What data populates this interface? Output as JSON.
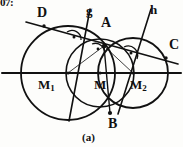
{
  "figure": {
    "caption": "(a)",
    "cropped_header_text": "07:",
    "ink_color": "#111111",
    "background_color": "#fdfdfb",
    "stroke_width": 1.6
  },
  "points": [
    {
      "id": "D",
      "label": "D",
      "x": 44,
      "y": 26,
      "label_x": 38,
      "label_y": 8
    },
    {
      "id": "A",
      "label": "A",
      "x": 104,
      "y": 46,
      "label_x": 103,
      "label_y": 20
    },
    {
      "id": "B",
      "label": "B",
      "x": 110,
      "y": 113,
      "label_x": 110,
      "label_y": 119
    },
    {
      "id": "C",
      "label": "C",
      "x": 166,
      "y": 58,
      "label_x": 170,
      "label_y": 40
    },
    {
      "id": "M",
      "label": "M",
      "x": 100,
      "y": 73,
      "label_x": 96,
      "label_y": 78
    },
    {
      "id": "M1",
      "label": "M",
      "sub": "1",
      "x": 68,
      "y": 73,
      "label_x": 40,
      "label_y": 79
    },
    {
      "id": "M2",
      "label": "M",
      "sub": "2",
      "x": 133,
      "y": 73,
      "label_x": 133,
      "label_y": 79
    }
  ],
  "lines": [
    {
      "id": "g",
      "label": "g",
      "label_x": 88,
      "label_y": 8,
      "x1": 89,
      "y1": 10,
      "x2": 70,
      "y2": 120
    },
    {
      "id": "h",
      "label": "h",
      "label_x": 152,
      "label_y": 7,
      "x1": 150,
      "y1": 10,
      "x2": 119,
      "y2": 113
    },
    {
      "id": "secant-DAC",
      "label": "",
      "x1": 26,
      "y1": 22,
      "x2": 178,
      "y2": 64
    },
    {
      "id": "center-line",
      "label": "",
      "x1": 2,
      "y1": 73,
      "x2": 181,
      "y2": 73
    }
  ],
  "circles": [
    {
      "id": "circle-M1",
      "center_x": 68,
      "center_y": 73,
      "radius": 47
    },
    {
      "id": "circle-M2",
      "center_x": 133,
      "center_y": 73,
      "radius": 35
    },
    {
      "id": "circle-M",
      "center_x": 100,
      "center_y": 73,
      "radius": 34
    }
  ],
  "angle_marks": [
    {
      "id": "right-angle-left",
      "x": 74,
      "y": 37,
      "note": "right angle dot mark"
    },
    {
      "id": "right-angle-middle",
      "x": 99,
      "y": 48,
      "note": "right angle dot mark"
    },
    {
      "id": "right-angle-right",
      "x": 131,
      "y": 53,
      "note": "right angle dot mark"
    }
  ]
}
